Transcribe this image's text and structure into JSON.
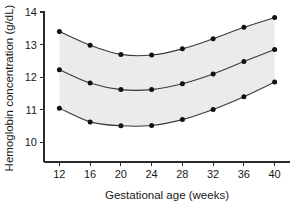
{
  "chart_data": {
    "type": "line",
    "title": "",
    "subtitle": "",
    "xlabel": "Gestational age (weeks)",
    "ylabel": "Hemoglobin concentration (g/dL)",
    "x": [
      12,
      16,
      20,
      24,
      28,
      32,
      36,
      40
    ],
    "xlim": [
      10,
      42
    ],
    "ylim": [
      9.4,
      14.0
    ],
    "xticks": [
      12,
      16,
      20,
      24,
      28,
      32,
      36,
      40
    ],
    "xticklabels": [
      "12",
      "16",
      "20",
      "24",
      "28",
      "32",
      "36",
      "40"
    ],
    "yticks": [
      10,
      11,
      12,
      13,
      14
    ],
    "yticklabels": [
      "10",
      "11",
      "12",
      "13",
      "14"
    ],
    "grid": false,
    "legend": false,
    "legend_position": "none",
    "shaded_band": {
      "label": "reference range band",
      "between": [
        "upper",
        "lower"
      ],
      "color": "#eceaea"
    },
    "series": [
      {
        "name": "upper",
        "values": [
          13.4,
          12.98,
          12.7,
          12.68,
          12.87,
          13.18,
          13.53,
          13.83
        ]
      },
      {
        "name": "median",
        "values": [
          12.23,
          11.82,
          11.62,
          11.62,
          11.8,
          12.1,
          12.48,
          12.85
        ]
      },
      {
        "name": "lower",
        "values": [
          11.05,
          10.63,
          10.51,
          10.52,
          10.7,
          11.01,
          11.4,
          11.85
        ]
      }
    ],
    "marker": "filled-circle",
    "line_color": "#3a3a3a",
    "marker_color": "#111111",
    "axis_color": "#2b2b2b",
    "background_color": "#ffffff"
  }
}
